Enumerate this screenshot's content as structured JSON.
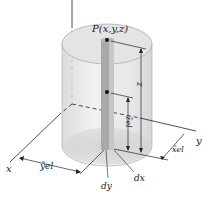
{
  "figure": {
    "point_label": "P(x,y,z)",
    "height_label": "z",
    "centroid_z_label": "z̃el",
    "centroid_x_label": "x̃el",
    "centroid_y_label": "ỹel",
    "axis_x_label": "x",
    "axis_y_label": "y",
    "element_dy_label": "dy",
    "element_dx_label": "dx",
    "colors": {
      "cylinder_fill": "#e8e8e8",
      "cylinder_top": "#dcdcdc",
      "column_front": "#a9a9a9",
      "column_side": "#c4c4c4",
      "lines": "#222222"
    }
  }
}
